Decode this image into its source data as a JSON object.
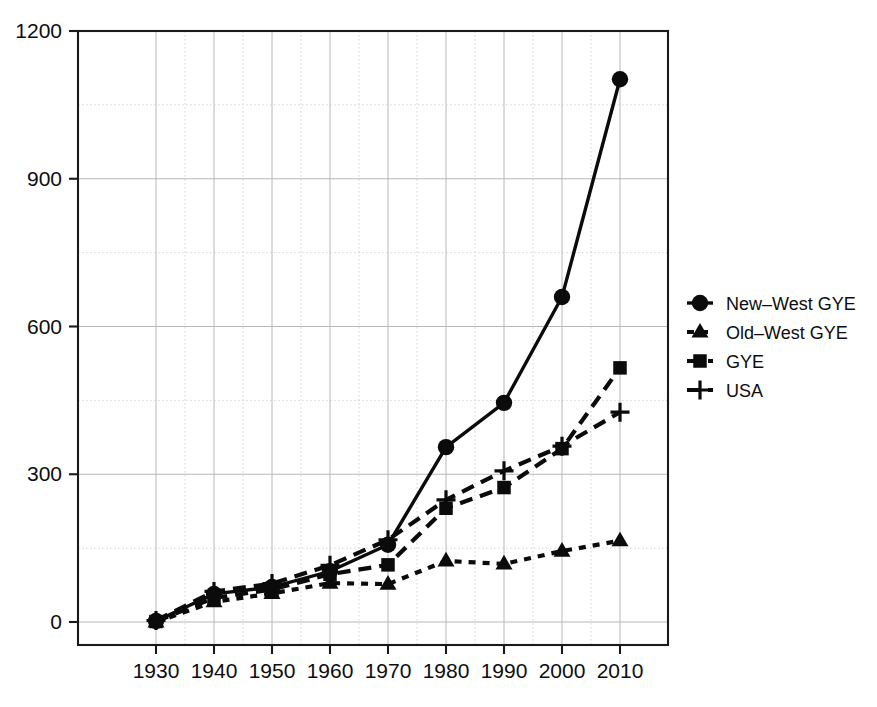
{
  "chart_data": {
    "type": "line",
    "title": "",
    "subtitle": "",
    "xlabel": "",
    "ylabel": "",
    "x": [
      1930,
      1940,
      1950,
      1960,
      1970,
      1980,
      1990,
      2000,
      2010
    ],
    "xtick_labels": [
      "1930",
      "1940",
      "1950",
      "1960",
      "1970",
      "1980",
      "1990",
      "2000",
      "2010"
    ],
    "ytick_labels": [
      "0",
      "300",
      "600",
      "900",
      "1200"
    ],
    "yticks": [
      0,
      300,
      600,
      900,
      1200
    ],
    "xlim": [
      1925,
      2015
    ],
    "ylim": [
      0,
      1200
    ],
    "grid": true,
    "grid_minor_step": 150,
    "legend_position": "right-outside",
    "series": [
      {
        "name": "New-West GYE",
        "marker": "circle",
        "linestyle": "solid",
        "color": "#0b0b0b",
        "values": [
          2,
          57,
          71,
          103,
          157,
          355,
          445,
          660,
          1102
        ]
      },
      {
        "name": "Old-West GYE",
        "marker": "triangle",
        "linestyle": "dotted",
        "color": "#0b0b0b",
        "values": [
          0,
          41,
          58,
          79,
          77,
          124,
          118,
          144,
          165
        ]
      },
      {
        "name": "GYE",
        "marker": "square",
        "linestyle": "dashed",
        "color": "#0b0b0b",
        "values": [
          1,
          49,
          66,
          97,
          116,
          231,
          273,
          352,
          516
        ]
      },
      {
        "name": "USA",
        "marker": "plus",
        "linestyle": "dashed",
        "color": "#0b0b0b",
        "values": [
          3,
          62,
          78,
          115,
          167,
          248,
          307,
          357,
          426
        ]
      }
    ]
  },
  "legend": {
    "items": [
      {
        "label": "New-West GYE",
        "marker": "circle"
      },
      {
        "label": "Old-West GYE",
        "marker": "triangle"
      },
      {
        "label": "GYE",
        "marker": "square"
      },
      {
        "label": "USA",
        "marker": "plus"
      }
    ]
  },
  "colors": {
    "foreground": "#0b0b0b",
    "axis": "#1a1a1a",
    "grid_major": "#b8b8b8",
    "grid_minor": "#cfcfcf",
    "background": "#ffffff"
  }
}
